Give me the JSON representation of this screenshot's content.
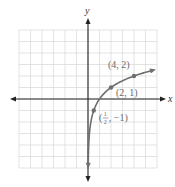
{
  "chart_data": {
    "type": "line",
    "title": "",
    "function": "y = log2(x)",
    "xlabel": "x",
    "ylabel": "y",
    "xlim": [
      -6,
      6
    ],
    "ylim": [
      -6,
      6
    ],
    "grid": true,
    "series": [
      {
        "name": "log2(x)",
        "x": [
          0.02,
          0.05,
          0.1,
          0.25,
          0.5,
          1,
          2,
          3,
          4,
          5.5
        ],
        "y": [
          -5.64,
          -4.32,
          -3.32,
          -2,
          -1,
          0,
          1,
          1.58,
          2,
          2.46
        ]
      }
    ],
    "points": [
      {
        "x": 4,
        "y": 2,
        "label": "(4, 2)"
      },
      {
        "x": 2,
        "y": 1,
        "label": "(2, 1)"
      },
      {
        "x": 0.5,
        "y": -1,
        "label": "(1/2, −1)",
        "label_num": "1",
        "label_den": "2",
        "label_rest": "−1"
      }
    ],
    "colors": {
      "curve": "#6e6e6e",
      "grid": "#dcdcdc",
      "axis": "#222222",
      "point": "#6e6e6e"
    }
  }
}
